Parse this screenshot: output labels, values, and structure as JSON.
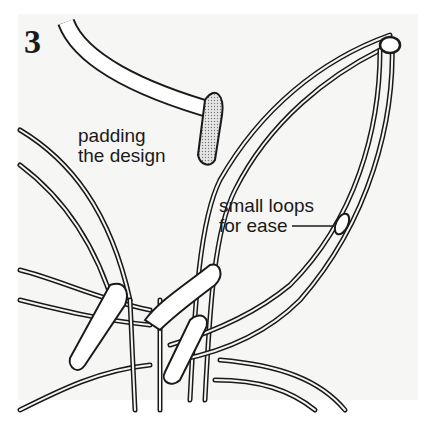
{
  "figure": {
    "step_number": "3",
    "labels": {
      "padding": [
        "padding",
        "the design"
      ],
      "loops": [
        "small loops",
        "for ease"
      ]
    },
    "colors": {
      "ink": "#1a1a1a",
      "paper": "#f6f6f4",
      "cord_fill": "#ffffff",
      "padding_fill": "#c8c8c8"
    }
  }
}
